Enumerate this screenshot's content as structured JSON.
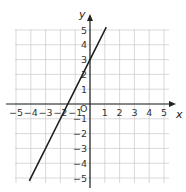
{
  "chart_data": {
    "type": "line",
    "title": "",
    "xlabel": "x",
    "ylabel": "y",
    "origin_label": "O",
    "xlim": [
      -5,
      5
    ],
    "ylim": [
      -5,
      5
    ],
    "grid": true,
    "x_ticks": [
      "-5",
      "-4",
      "-3",
      "-2",
      "-1",
      "1",
      "2",
      "3",
      "4",
      "5"
    ],
    "y_ticks": [
      "5",
      "4",
      "3",
      "2",
      "1",
      "-1",
      "-2",
      "-3",
      "-4",
      "-5"
    ],
    "series": [
      {
        "name": "y = 2x + 3",
        "slope": 2,
        "intercept": 3,
        "x": [
          -4.1,
          1.1
        ],
        "y": [
          -5.2,
          5.2
        ]
      }
    ],
    "colors": {
      "grid": "#c8c8c8",
      "axis": "#222222",
      "line": "#1a1a1a"
    }
  }
}
